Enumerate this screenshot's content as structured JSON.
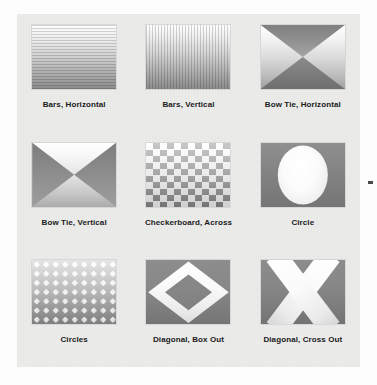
{
  "page": {
    "background_color": "#fdfdfd",
    "panel_color": "#ececeb",
    "label_color": "#1a1a1a"
  },
  "gallery": {
    "columns": 3,
    "rows": 3,
    "effects": [
      {
        "label": "Bars, Horizontal",
        "icon": "bars-horizontal-swatch",
        "pattern": "horizontal-bars"
      },
      {
        "label": "Bars, Vertical",
        "icon": "bars-vertical-swatch",
        "pattern": "vertical-bars"
      },
      {
        "label": "Bow Tie, Horizontal",
        "icon": "bow-tie-horizontal-swatch",
        "pattern": "bow-tie-horizontal"
      },
      {
        "label": "Bow Tie, Vertical",
        "icon": "bow-tie-vertical-swatch",
        "pattern": "bow-tie-vertical"
      },
      {
        "label": "Checkerboard, Across",
        "icon": "checkerboard-swatch",
        "pattern": "checkerboard"
      },
      {
        "label": "Circle",
        "icon": "circle-swatch",
        "pattern": "circle"
      },
      {
        "label": "Circles",
        "icon": "circles-swatch",
        "pattern": "circle-grid"
      },
      {
        "label": "Diagonal, Box Out",
        "icon": "diagonal-box-out-swatch",
        "pattern": "diamond-ring"
      },
      {
        "label": "Diagonal, Cross Out",
        "icon": "diagonal-cross-out-swatch",
        "pattern": "cross-x"
      }
    ]
  },
  "artifact": {
    "name": "scan-artifact-dash",
    "color": "#4a4a4a"
  }
}
